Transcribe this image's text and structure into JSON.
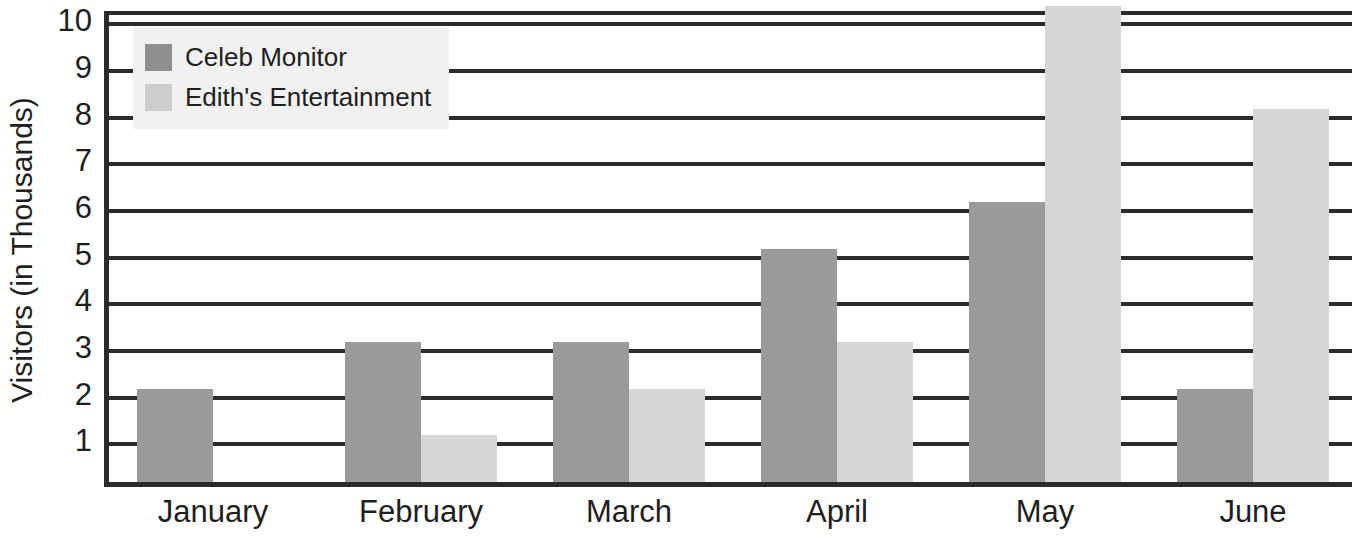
{
  "chart_data": {
    "type": "bar",
    "title": "",
    "subtitle": "",
    "xlabel": "",
    "ylabel": "Visitors (in Thousands)",
    "categories": [
      "January",
      "February",
      "March",
      "April",
      "May",
      "June"
    ],
    "series": [
      {
        "name": "Celeb Monitor",
        "color": "#9a9a9a",
        "values": [
          2,
          3,
          3,
          5,
          6,
          2
        ]
      },
      {
        "name": "Edith's Entertainment",
        "color": "#d6d6d6",
        "values": [
          0,
          1,
          2,
          3,
          10.2,
          8
        ]
      }
    ],
    "ylim": [
      0,
      10.2
    ],
    "yticks": [
      10,
      9,
      8,
      7,
      6,
      5,
      4,
      3,
      2,
      1
    ],
    "ytick_labels": [
      "10",
      "9",
      "8",
      "7",
      "6",
      "5",
      "4",
      "3",
      "2",
      "1"
    ],
    "grid": true,
    "grid_axis": "y",
    "legend_position": "top-left"
  },
  "legend": {
    "entries": [
      {
        "label": "Celeb Monitor",
        "swatch_color": "#8f8f8f"
      },
      {
        "label": "Edith's Entertainment",
        "swatch_color": "#cdcdcd"
      }
    ],
    "background_color": "#f1f1f1"
  },
  "axes": {
    "y_title": "Visitors (in Thousands)",
    "y_tick_labels": [
      "10",
      "9",
      "8",
      "7",
      "6",
      "5",
      "4",
      "3",
      "2",
      "1"
    ],
    "x_tick_labels": [
      "January",
      "February",
      "March",
      "April",
      "May",
      "June"
    ],
    "frame_color": "#2b2b2b"
  }
}
